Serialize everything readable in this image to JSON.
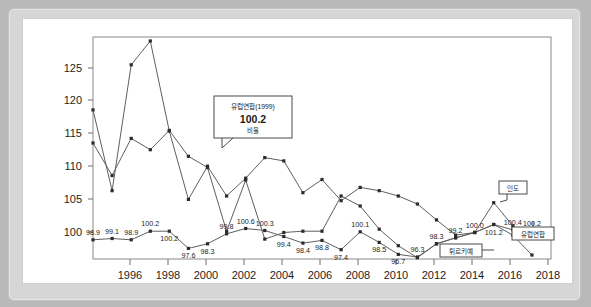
{
  "chart_data": {
    "type": "line",
    "title": "",
    "xlabel": "",
    "ylabel": "",
    "ylim": [
      96,
      129.5
    ],
    "xlim": [
      1995,
      2019
    ],
    "grid": false,
    "legend_position": "annotations",
    "yticks": [
      100,
      105,
      110,
      115,
      120,
      125
    ],
    "xticks": [
      1996,
      1998,
      2000,
      2002,
      2004,
      2006,
      2008,
      2010,
      2012,
      2014,
      2016,
      2018
    ],
    "x": [
      1995,
      1996,
      1997,
      1998,
      1999,
      2000,
      2001,
      2002,
      2003,
      2004,
      2005,
      2006,
      2007,
      2008,
      2009,
      2010,
      2011,
      2012,
      2013,
      2014,
      2015,
      2016,
      2017,
      2018,
      2019
    ],
    "series": [
      {
        "name": "인도",
        "values": [
          118.5,
          106.3,
          125.3,
          128.9,
          115.3,
          105.0,
          110.0,
          105.5,
          108.2,
          111.3,
          110.8,
          106.0,
          108.0,
          104.8,
          106.8,
          106.3,
          105.5,
          104.3,
          101.9,
          99.6,
          100.0,
          104.5,
          101.0,
          99.2,
          null
        ]
      },
      {
        "name": "튀르키예",
        "values": [
          113.5,
          108.6,
          114.2,
          112.5,
          115.4,
          111.5,
          109.8,
          100.2,
          107.9,
          99.0,
          100.0,
          100.2,
          100.2,
          105.5,
          104.0,
          100.5,
          98.0,
          96.2,
          98.3,
          99.2,
          100.0,
          101.2,
          99.6,
          96.6,
          null
        ]
      },
      {
        "name": "유럽연합",
        "values": [
          98.9,
          99.1,
          98.9,
          100.2,
          100.2,
          97.6,
          98.3,
          99.8,
          100.6,
          100.3,
          99.4,
          98.4,
          98.8,
          97.4,
          100.1,
          98.5,
          96.7,
          96.3,
          98.3,
          99.2,
          100.0,
          101.2,
          100.4,
          100.2,
          100.2
        ]
      }
    ],
    "point_labels": [
      {
        "text": "98.9",
        "x": 1995
      },
      {
        "text": "99.1",
        "x": 1996
      },
      {
        "text": "98.9",
        "x": 1997
      },
      {
        "text": "100.2",
        "x": 1998
      },
      {
        "text": "100.2",
        "x": 1999
      },
      {
        "text": "97.6",
        "x": 2000
      },
      {
        "text": "98.3",
        "x": 2001
      },
      {
        "text": "99.8",
        "x": 2002
      },
      {
        "text": "100.6",
        "x": 2003
      },
      {
        "text": "100.3",
        "x": 2004
      },
      {
        "text": "99.4",
        "x": 2005
      },
      {
        "text": "98.4",
        "x": 2006
      },
      {
        "text": "98.8",
        "x": 2007
      },
      {
        "text": "97.4",
        "x": 2008
      },
      {
        "text": "100.1",
        "x": 2009
      },
      {
        "text": "98.5",
        "x": 2010
      },
      {
        "text": "96.7",
        "x": 2011
      },
      {
        "text": "96.3",
        "x": 2012
      },
      {
        "text": "98.3",
        "x": 2013
      },
      {
        "text": "99.2",
        "x": 2014
      },
      {
        "text": "100.0",
        "x": 2015
      },
      {
        "text": "101.2",
        "x": 2016
      },
      {
        "text": "100.4",
        "x": 2017
      },
      {
        "text": "100.2",
        "x": 2018
      }
    ],
    "annotations": [
      {
        "name": "tooltip",
        "title": "유럽연합(1999)",
        "value": "100.2",
        "unit": "비율"
      },
      {
        "name": "callout-india",
        "text": "인도"
      },
      {
        "name": "callout-turkiye",
        "text": "튀르키예"
      },
      {
        "name": "callout-eu",
        "text": "유럽연합"
      }
    ]
  },
  "axis": {
    "y_labels": [
      "125",
      "120",
      "115",
      "110",
      "105",
      "100"
    ],
    "x_labels": [
      "1996",
      "1998",
      "2000",
      "2002",
      "2004",
      "2006",
      "2008",
      "2010",
      "2012",
      "2014",
      "2016",
      "2018"
    ]
  },
  "tooltip": {
    "title": "유럽연합(1999)",
    "value": "100.2",
    "unit": "비율"
  },
  "callouts": {
    "india": "인도",
    "turkiye": "튀르키예",
    "eu": "유럽연합"
  },
  "labels": {
    "l1995": "98.9",
    "l1996": "99.1",
    "l1997": "98.9",
    "l1998": "100.2",
    "l1999": "100.2",
    "l2000": "97.6",
    "l2001": "98.3",
    "l2002": "99.8",
    "l2003": "100.6",
    "l2004": "100.3",
    "l2005": "99.4",
    "l2006": "98.4",
    "l2007": "98.8",
    "l2008": "97.4",
    "l2009": "100.1",
    "l2010": "98.5",
    "l2011": "96.7",
    "l2012": "96.3",
    "l2013": "98.3",
    "l2014": "99.2",
    "l2015": "100.0",
    "l2016": "101.2",
    "l2017": "100.4",
    "l2018": "100.2"
  },
  "colors": {
    "outer_background": "#b9b9b9",
    "panel": "#d6d6d6",
    "card": "#ffffff",
    "line": "#5f5f5f",
    "marker": "#2b2b2b",
    "axis": "#8a8a8a",
    "text": "#1d1d1d"
  }
}
